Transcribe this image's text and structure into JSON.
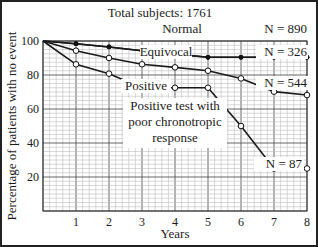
{
  "chart_data": {
    "type": "line",
    "title": "Total subjects: 1761",
    "xlabel": "Years",
    "ylabel": "Percentage of patients with no event",
    "xlim": [
      0,
      8
    ],
    "ylim": [
      0,
      100
    ],
    "x_ticks": [
      1,
      2,
      3,
      4,
      5,
      6,
      7,
      8
    ],
    "y_ticks": [
      20,
      40,
      60,
      80,
      100
    ],
    "grid": true,
    "x": [
      0,
      1,
      2,
      3,
      4,
      5,
      6,
      7,
      8
    ],
    "series": [
      {
        "name": "Normal",
        "n_label": "N = 890",
        "marker": "filled-circle",
        "values": [
          100,
          98.4,
          96.5,
          94.3,
          92.3,
          90.4,
          90.4,
          90.4,
          90.4
        ]
      },
      {
        "name": "Equivocal",
        "n_label": "N = 326",
        "marker": "filled-circle",
        "values": [
          100,
          98.4,
          96.5,
          94.3,
          92.3,
          90.4,
          90.4,
          90.4,
          90.4
        ]
      },
      {
        "name": "Positive",
        "n_label": "N = 544",
        "marker": "open-circle",
        "values": [
          100,
          94.3,
          90,
          86.3,
          84.5,
          82.5,
          78,
          70.2,
          68.2
        ]
      },
      {
        "name": "Positive test with poor chronotropic response",
        "n_label": "N = 87",
        "marker": "open-circle",
        "values": [
          100,
          86.3,
          80.8,
          72.5,
          72.5,
          72.5,
          50,
          25,
          25
        ]
      }
    ],
    "annotations": [
      "Normal",
      "Equivocal",
      "Positive",
      "Positive test with poor chronotropic response",
      "N = 890",
      "N = 326",
      "N = 544",
      "N = 87"
    ]
  },
  "labels": {
    "title": "Total subjects: 1761",
    "xlabel": "Years",
    "ylabel": "Percentage of patients with no event",
    "normal": "Normal",
    "equivocal": "Equivocal",
    "positive": "Positive",
    "poor_line1": "Positive test with",
    "poor_line2": "poor chronotropic",
    "poor_line3": "response",
    "n_normal": "N = 890",
    "n_equivocal": "N = 326",
    "n_positive": "N = 544",
    "n_poor": "N = 87"
  }
}
